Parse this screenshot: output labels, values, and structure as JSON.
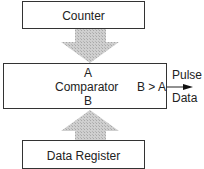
{
  "diagram": {
    "blocks": {
      "counter": {
        "label": "Counter"
      },
      "comparator": {
        "label": "Comparator",
        "input_a": "A",
        "input_b": "B",
        "condition": "B > A"
      },
      "data_register": {
        "label": "Data Register"
      }
    },
    "output": {
      "top_label": "Pulse",
      "bottom_label": "Data"
    },
    "colors": {
      "arrow_fill": "#c8c8c8",
      "border": "#333333"
    }
  }
}
